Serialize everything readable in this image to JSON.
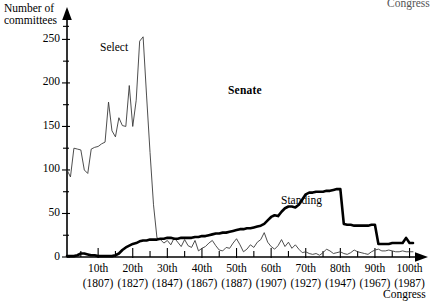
{
  "figure": {
    "title": "Senate",
    "axis_y_title_line1": "Number of",
    "axis_y_title_line2": "committees",
    "axis_x_title_bottom": "Congress",
    "axis_x_title_top": "Congress"
  },
  "chart_data": {
    "type": "line",
    "title": "Senate",
    "xlabel": "Congress",
    "ylabel": "Number of committees",
    "xlim": [
      1,
      101
    ],
    "ylim": [
      0,
      270
    ],
    "grid": false,
    "legend": "inline-annotations",
    "y_ticks_major": [
      0,
      50,
      100,
      150,
      200,
      250
    ],
    "y_ticks_minor": [
      25,
      75,
      125,
      175,
      225,
      265
    ],
    "x_ticks_major": [
      10,
      20,
      30,
      40,
      50,
      60,
      70,
      80,
      90,
      100
    ],
    "x_tick_labels_congress": [
      "10th",
      "20th",
      "30th",
      "40th",
      "50th",
      "60th",
      "70th",
      "80th",
      "90th",
      "100th"
    ],
    "x_tick_labels_year": [
      "(1807)",
      "(1827)",
      "(1847)",
      "(1867)",
      "(1887)",
      "(1907)",
      "(1927)",
      "(1947)",
      "(1967)",
      "(1987)"
    ],
    "series": [
      {
        "name": "Select",
        "label": "Select",
        "style": "thin",
        "x": [
          1,
          2,
          3,
          4,
          5,
          6,
          7,
          8,
          9,
          10,
          11,
          12,
          13,
          14,
          15,
          16,
          17,
          18,
          19,
          20,
          21,
          22,
          23,
          24,
          25,
          26,
          27,
          28,
          29,
          30,
          31,
          32,
          33,
          34,
          35,
          36,
          37,
          38,
          39,
          40,
          41,
          42,
          43,
          44,
          45,
          46,
          47,
          48,
          49,
          50,
          51,
          52,
          53,
          54,
          55,
          56,
          57,
          58,
          59,
          60,
          61,
          62,
          63,
          64,
          65,
          66,
          67,
          68,
          69,
          70,
          71,
          72,
          73,
          74,
          75,
          76,
          77,
          78,
          79,
          80,
          81,
          82,
          83,
          84,
          85,
          86,
          87,
          88,
          89,
          90,
          91,
          92,
          93,
          94,
          95,
          96,
          97,
          98,
          99,
          100,
          101
        ],
        "values": [
          100,
          92,
          125,
          124,
          123,
          100,
          96,
          124,
          126,
          127,
          130,
          132,
          178,
          145,
          138,
          160,
          151,
          150,
          197,
          150,
          180,
          248,
          253,
          185,
          120,
          60,
          22,
          20,
          16,
          19,
          14,
          22,
          17,
          12,
          20,
          13,
          11,
          19,
          7,
          10,
          12,
          16,
          19,
          13,
          8,
          7,
          11,
          10,
          16,
          21,
          14,
          6,
          9,
          14,
          11,
          17,
          20,
          28,
          17,
          12,
          9,
          13,
          20,
          12,
          17,
          10,
          14,
          9,
          5,
          6,
          4,
          3,
          4,
          2,
          5,
          9,
          7,
          4,
          5,
          6,
          4,
          3,
          5,
          8,
          6,
          5,
          4,
          3,
          6,
          8,
          9,
          7,
          7,
          8,
          7,
          6,
          6,
          7,
          6,
          6,
          6
        ]
      },
      {
        "name": "Standing",
        "label": "Standing",
        "style": "thick",
        "x": [
          1,
          2,
          3,
          4,
          5,
          6,
          7,
          8,
          9,
          10,
          11,
          12,
          13,
          14,
          15,
          16,
          17,
          18,
          19,
          20,
          21,
          22,
          23,
          24,
          25,
          26,
          27,
          28,
          29,
          30,
          31,
          32,
          33,
          34,
          35,
          36,
          37,
          38,
          39,
          40,
          41,
          42,
          43,
          44,
          45,
          46,
          47,
          48,
          49,
          50,
          51,
          52,
          53,
          54,
          55,
          56,
          57,
          58,
          59,
          60,
          61,
          62,
          63,
          64,
          65,
          66,
          67,
          68,
          69,
          70,
          71,
          72,
          73,
          74,
          75,
          76,
          77,
          78,
          79,
          80,
          81,
          82,
          83,
          84,
          85,
          86,
          87,
          88,
          89,
          90,
          91,
          92,
          93,
          94,
          95,
          96,
          97,
          98,
          99,
          100,
          101
        ],
        "values": [
          1,
          1,
          1,
          2,
          4,
          4,
          3,
          2,
          2,
          1,
          1,
          1,
          1,
          1,
          2,
          4,
          8,
          11,
          13,
          15,
          16,
          18,
          19,
          19,
          20,
          20,
          20,
          21,
          21,
          22,
          22,
          21,
          21,
          22,
          22,
          22,
          22,
          23,
          23,
          24,
          24,
          25,
          26,
          27,
          27,
          28,
          28,
          29,
          30,
          31,
          32,
          32,
          33,
          33,
          34,
          35,
          36,
          38,
          42,
          46,
          48,
          47,
          52,
          56,
          58,
          58,
          57,
          60,
          66,
          72,
          74,
          74,
          75,
          75,
          75,
          76,
          76,
          77,
          78,
          78,
          38,
          37,
          37,
          36,
          36,
          36,
          36,
          36,
          37,
          37,
          15,
          15,
          15,
          15,
          16,
          16,
          16,
          16,
          22,
          16,
          16
        ]
      }
    ],
    "annotations": [
      {
        "text": "Select",
        "near_series": "Select"
      },
      {
        "text": "Standing",
        "near_series": "Standing"
      },
      {
        "text": "Senate",
        "role": "plot-title"
      }
    ]
  }
}
